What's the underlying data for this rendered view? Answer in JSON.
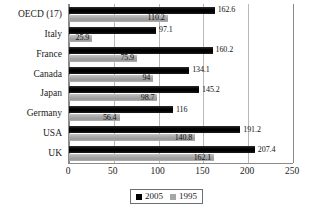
{
  "chart": {
    "type": "bar",
    "orientation": "horizontal",
    "title": "",
    "xlabel": "",
    "ylabel": "",
    "grid": true,
    "legend_position": "bottom-center"
  },
  "chart_data": {
    "type": "bar",
    "title": "",
    "xlabel": "",
    "ylabel": "",
    "xlim": [
      0,
      250
    ],
    "xticks": [
      "0",
      "50",
      "100",
      "150",
      "200",
      "250"
    ],
    "xtick_values": [
      0,
      50,
      100,
      150,
      200,
      250
    ],
    "grid": true,
    "legend_position": "bottom-center",
    "categories": [
      "OECD (17)",
      "Italy",
      "France",
      "Canada",
      "Japan",
      "Germany",
      "USA",
      "UK"
    ],
    "series": [
      {
        "name": "2005",
        "color": "#000000",
        "values": [
          162.6,
          97.1,
          160.2,
          134.1,
          145.2,
          116,
          191.2,
          207.4
        ],
        "labels": [
          "162.6",
          "97.1",
          "160.2",
          "134.1",
          "145.2",
          "116",
          "191.2",
          "207.4"
        ]
      },
      {
        "name": "1995",
        "color": "#a6a6a6",
        "values": [
          110.2,
          25.9,
          75.9,
          94,
          98.7,
          56.4,
          140.8,
          162.1
        ],
        "labels": [
          "110.2",
          "25.9",
          "75.9",
          "94",
          "98.7",
          "56.4",
          "140.8",
          "162.1"
        ]
      }
    ]
  },
  "legend": {
    "items": [
      {
        "label": "2005",
        "color": "#000000"
      },
      {
        "label": "1995",
        "color": "#a6a6a6"
      }
    ]
  }
}
